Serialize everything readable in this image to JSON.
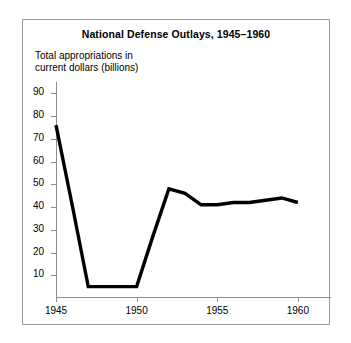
{
  "figure": {
    "title": "National Defense Outlays, 1945–1960",
    "axis_label_line1": "Total appropriations in",
    "axis_label_line2": "current dollars (billions)",
    "line_color": "#000000",
    "frame_color": "#9a9a9a",
    "axis_color": "#8c8c8c",
    "background_color": "#ffffff"
  },
  "chart_data": {
    "type": "line",
    "title": "National Defense Outlays, 1945–1960",
    "xlabel": "",
    "ylabel": "Total appropriations in current dollars (billions)",
    "xlim": [
      1945,
      1961
    ],
    "ylim": [
      0,
      95
    ],
    "grid": false,
    "legend": "none",
    "y_ticks": [
      10,
      20,
      30,
      40,
      50,
      60,
      70,
      80,
      90
    ],
    "y_tick_labels": [
      "10",
      "20",
      "30",
      "40",
      "50",
      "60",
      "70",
      "80",
      "90"
    ],
    "x_ticks": [
      1945,
      1950,
      1955,
      1960
    ],
    "x_tick_labels": [
      "1945",
      "1950",
      "1955",
      "1960"
    ],
    "x_minor_ticks": [
      1946,
      1947,
      1948,
      1949,
      1951,
      1952,
      1953,
      1954,
      1956,
      1957,
      1958,
      1959
    ],
    "x": [
      1945,
      1946,
      1947,
      1948,
      1949,
      1950,
      1951,
      1952,
      1953,
      1954,
      1955,
      1956,
      1957,
      1958,
      1959,
      1960
    ],
    "values": [
      76,
      41,
      5,
      5,
      5,
      5,
      27,
      48,
      46,
      41,
      41,
      42,
      42,
      43,
      44,
      42
    ],
    "series": [
      {
        "name": "Total appropriations in current dollars (billions)",
        "values": [
          76,
          41,
          5,
          5,
          5,
          5,
          27,
          48,
          46,
          41,
          41,
          42,
          42,
          43,
          44,
          42
        ]
      }
    ]
  }
}
